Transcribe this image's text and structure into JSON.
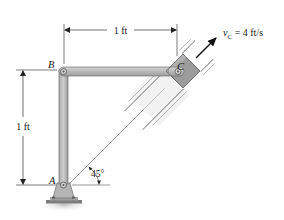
{
  "figure": {
    "type": "mechanism-diagram",
    "points": {
      "A": {
        "label": "A"
      },
      "B": {
        "label": "B"
      },
      "C": {
        "label": "C"
      }
    },
    "dimensions": {
      "horizontal": {
        "label": "1 ft"
      },
      "vertical": {
        "label": "1 ft"
      },
      "angle": {
        "label": "45°"
      }
    },
    "velocity": {
      "symbol": "v",
      "subscript": "C",
      "equals_value": " = 4 ft/s"
    },
    "colors": {
      "link_fill": "#b8b8b8",
      "link_edge": "#6e6e6e",
      "slider_fill": "#9a9a9a",
      "guide": "#7a7a7a",
      "line": "#333333",
      "ground": "#8a8a8a"
    }
  }
}
